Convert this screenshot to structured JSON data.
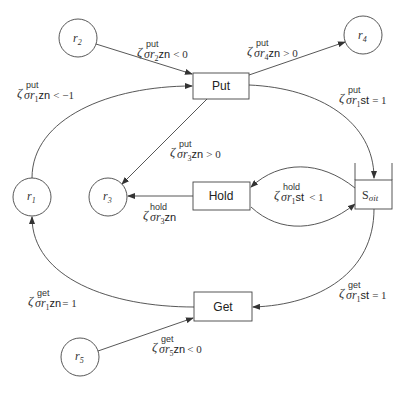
{
  "diagram": {
    "places": [
      {
        "id": "r2",
        "label_base": "r",
        "label_sub": "2"
      },
      {
        "id": "r4",
        "label_base": "r",
        "label_sub": "4"
      },
      {
        "id": "r1",
        "label_base": "r",
        "label_sub": "1"
      },
      {
        "id": "r3",
        "label_base": "r",
        "label_sub": "3"
      },
      {
        "id": "r5",
        "label_base": "r",
        "label_sub": "5"
      }
    ],
    "transitions": [
      {
        "id": "put",
        "label": "Put"
      },
      {
        "id": "hold",
        "label": "Hold"
      },
      {
        "id": "get",
        "label": "Get"
      }
    ],
    "queue": {
      "id": "s_sigma_it",
      "label_base": "S",
      "label_sub": "σit"
    },
    "edges": [
      {
        "from": "r2",
        "to": "put",
        "sup": "put",
        "sub": "2",
        "attr": "zn",
        "rel": "< 0"
      },
      {
        "from": "r1",
        "to": "put",
        "sup": "put",
        "sub": "1",
        "attr": "zn",
        "rel": "< −1"
      },
      {
        "from": "put",
        "to": "r4",
        "sup": "put",
        "sub": "4",
        "attr": "zn",
        "rel": "> 0"
      },
      {
        "from": "put",
        "to": "s_sigma_it",
        "sup": "put",
        "sub": "1",
        "attr": "st",
        "rel": "= 1"
      },
      {
        "from": "put",
        "to": "r3",
        "sup": "put",
        "sub": "3",
        "attr": "zn",
        "rel": "> 0"
      },
      {
        "from": "hold",
        "to": "r3",
        "sup": "hold",
        "sub": "3",
        "attr": "zn",
        "rel": ""
      },
      {
        "from": "s_sigma_it",
        "to": "hold",
        "sup": "hold",
        "sub": "1",
        "attr": "st",
        "rel": "< 1"
      },
      {
        "from": "s_sigma_it",
        "to": "get",
        "sup": "get",
        "sub": "1",
        "attr": "st",
        "rel": "= 1"
      },
      {
        "from": "get",
        "to": "r1",
        "sup": "get",
        "sub": "1",
        "attr": "zn",
        "rel": "= 1"
      },
      {
        "from": "r5",
        "to": "get",
        "sup": "get",
        "sub": "5",
        "attr": "zn",
        "rel": "< 0"
      }
    ],
    "zeta": "ζ",
    "sigma": "σ",
    "r": "r"
  }
}
